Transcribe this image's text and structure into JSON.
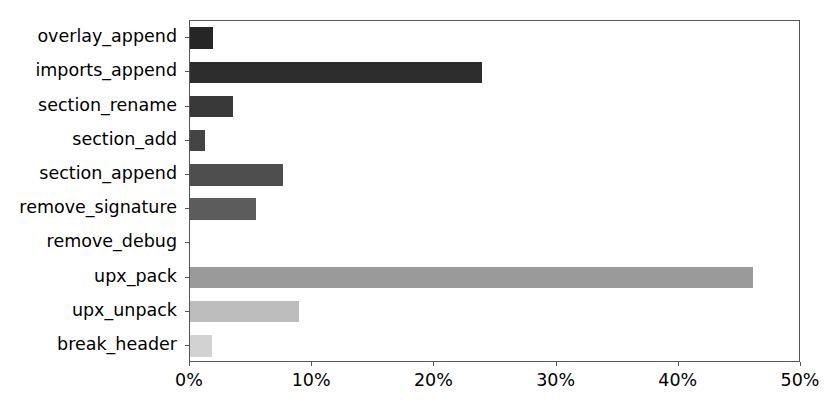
{
  "chart_data": {
    "type": "bar",
    "orientation": "horizontal",
    "title": "",
    "xlabel": "",
    "ylabel": "",
    "categories": [
      "overlay_append",
      "imports_append",
      "section_rename",
      "section_add",
      "section_append",
      "remove_signature",
      "remove_debug",
      "upx_pack",
      "upx_unpack",
      "break_header"
    ],
    "values": [
      1.9,
      23.9,
      3.5,
      1.2,
      7.6,
      5.4,
      0.0,
      46.1,
      8.9,
      1.8
    ],
    "value_unit": "%",
    "xlim": [
      0,
      50
    ],
    "xticks": [
      0,
      10,
      20,
      30,
      40,
      50
    ],
    "xtick_labels": [
      "0%",
      "10%",
      "20%",
      "30%",
      "40%",
      "50%"
    ],
    "grid": false,
    "legend": false,
    "bar_colors": [
      "#262626",
      "#2d2d2d",
      "#393939",
      "#444444",
      "#4e4e4e",
      "#5c5c5c",
      "#6e6e6e",
      "#9a9a9a",
      "#bdbdbd",
      "#d2d2d2"
    ],
    "axis_color": "#555555",
    "background_color": "#ffffff"
  }
}
